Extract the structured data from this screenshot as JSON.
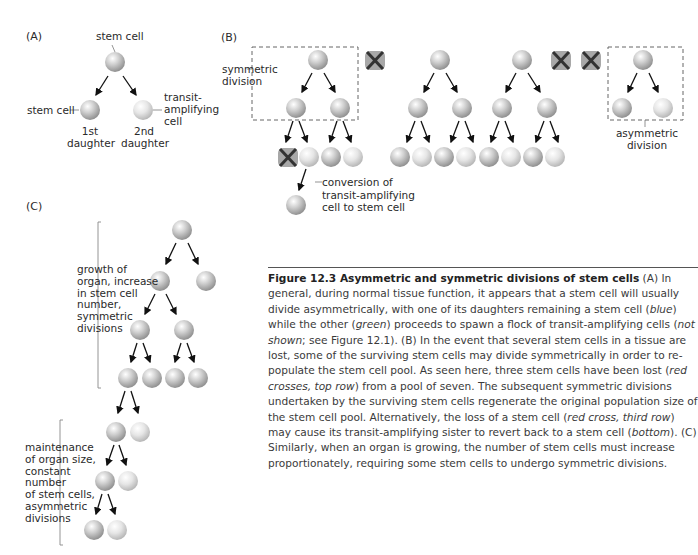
{
  "panels": {
    "a": {
      "label": "(A)",
      "stem_cell_top": "stem cell",
      "stem_cell_left": "stem cell",
      "transit_label": [
        "transit-",
        "amplifying",
        "cell"
      ],
      "daughter1": [
        "1st",
        "daughter"
      ],
      "daughter2": [
        "2nd",
        "daughter"
      ]
    },
    "b": {
      "label": "(B)",
      "symmetric_label": [
        "symmetric",
        "division"
      ],
      "asymmetric_label": [
        "asymmetric",
        "division"
      ],
      "conversion_label": [
        "conversion of",
        "transit-amplifying",
        "cell to stem cell"
      ]
    },
    "c": {
      "label": "(C)",
      "growth_label": [
        "growth of",
        "organ, increase",
        "in stem cell",
        "number,",
        "symmetric",
        "divisions"
      ],
      "maintenance_label": [
        "maintenance",
        "of organ size,",
        "constant",
        "number",
        "of stem cells,",
        "asymmetric",
        "divisions"
      ]
    }
  },
  "colors": {
    "stem_cell": "#b8b8b8",
    "transit_cell": "#dcdcdc",
    "cross": "#333333",
    "cross_bg": "#a8a8a8",
    "dashed_box": "#666666"
  },
  "caption": {
    "figure_number": "Figure 12.3",
    "title": "Asymmetric and symmetric divisions of stem cells",
    "body": [
      {
        "t": " (A) In general, during normal tissue function, it appears that a stem cell will usually divide asymmetrically, with one of its daughters remaining a stem cell (",
        "i": false
      },
      {
        "t": "blue",
        "i": true
      },
      {
        "t": ") while the other (",
        "i": false
      },
      {
        "t": "green",
        "i": true
      },
      {
        "t": ") proceeds to spawn a flock of transit-amplifying cells (",
        "i": false
      },
      {
        "t": "not shown",
        "i": true
      },
      {
        "t": "; see Figure 12.1). (B) In the event that several stem cells in a tissue are lost, some of the surviving stem cells may divide symmetrically in order to re-populate the stem cell pool. As seen here, three stem cells have been lost (",
        "i": false
      },
      {
        "t": "red crosses, top row",
        "i": true
      },
      {
        "t": ") from a pool of seven. The subsequent symmetric divisions undertaken by the surviving stem cells regenerate the original population size of the stem cell pool. Alternatively, the loss of a stem cell (",
        "i": false
      },
      {
        "t": "red cross, third row",
        "i": true
      },
      {
        "t": ") may cause its transit-amplifying sister to revert back to a stem cell (",
        "i": false
      },
      {
        "t": "bottom",
        "i": true
      },
      {
        "t": "). (C) Similarly, when an organ is growing, the number of stem cells must increase proportionately, requiring some stem cells to undergo symmetric divisions.",
        "i": false
      }
    ]
  }
}
